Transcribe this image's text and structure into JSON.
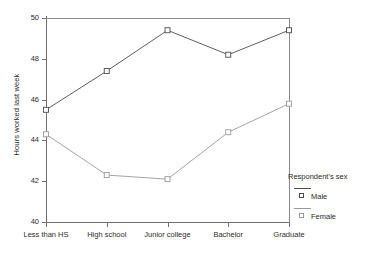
{
  "chart_data": {
    "type": "line",
    "title": "",
    "subtitle": "",
    "xlabel": "",
    "ylabel": "Hours worked last week",
    "categories": [
      "Less than HS",
      "High school",
      "Junior college",
      "Bachelor",
      "Graduate"
    ],
    "series": [
      {
        "name": "Male",
        "values": [
          45.5,
          47.4,
          49.4,
          48.2,
          49.4
        ],
        "color": "#4d4d4d",
        "marker": "open-square"
      },
      {
        "name": "Female",
        "values": [
          44.3,
          42.3,
          42.1,
          44.4,
          45.8
        ],
        "color": "#9a9a9a",
        "marker": "open-square"
      }
    ],
    "ylim": [
      40,
      50
    ],
    "yticks": [
      40,
      42,
      44,
      46,
      48,
      50
    ],
    "ytick_labels": [
      "40",
      "42",
      "44",
      "46",
      "48",
      "50"
    ],
    "grid": false,
    "legend": {
      "title": "Respondent's sex",
      "position": "right",
      "entries": [
        {
          "label": "Male",
          "color": "#4d4d4d"
        },
        {
          "label": "Female",
          "color": "#9a9a9a"
        }
      ]
    },
    "axis_color": "#707070",
    "plot_background": "#ffffff"
  }
}
